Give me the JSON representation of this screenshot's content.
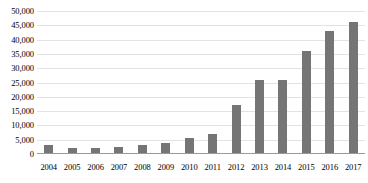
{
  "chart_data": {
    "type": "bar",
    "title": "",
    "xlabel": "",
    "ylabel": "",
    "categories": [
      "2004",
      "2005",
      "2006",
      "2007",
      "2008",
      "2009",
      "2010",
      "2011",
      "2012",
      "2013",
      "2014",
      "2015",
      "2016",
      "2017"
    ],
    "values": [
      3000,
      2200,
      2200,
      2600,
      3000,
      4000,
      5500,
      7000,
      17000,
      26000,
      26000,
      36000,
      43000,
      46000
    ],
    "ylim": [
      0,
      50000
    ],
    "ytick_step": 5000,
    "ytick_labels": [
      "50,000",
      "45,000",
      "40,000",
      "35,000",
      "30,000",
      "25,000",
      "20,000",
      "15,000",
      "10,000",
      "5,000",
      "0"
    ],
    "ytick_values": [
      50000,
      45000,
      40000,
      35000,
      30000,
      25000,
      20000,
      15000,
      10000,
      5000,
      0
    ],
    "grid": true,
    "legend": false,
    "legend_position": "none",
    "colors": {
      "bar": "#757575",
      "gridline": "#e3e3e3",
      "axis": "#9a9a9a",
      "text": "#000000",
      "background": "#ffffff"
    }
  }
}
